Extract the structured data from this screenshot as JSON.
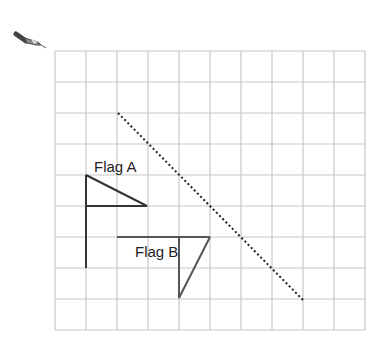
{
  "tool_icon": "pen-icon",
  "grid": {
    "cols": 10,
    "rows": 9,
    "x0": 55,
    "y0": 51,
    "cell": 31,
    "color": "#c8c8c8"
  },
  "labels": {
    "flag_a": "Flag A",
    "flag_b": "Flag B"
  },
  "colors": {
    "flag_a": "#333333",
    "flag_b": "#555555",
    "mirror_line": "#222222"
  }
}
